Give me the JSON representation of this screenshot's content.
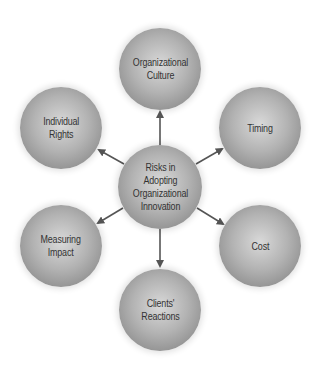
{
  "diagram": {
    "center": {
      "label": "Risks in\nAdopting\nOrganizational\nInnovation",
      "x": 160,
      "y": 187,
      "r": 42
    },
    "nodes": [
      {
        "id": "organizational-culture",
        "label": "Organizational\nCulture",
        "x": 160,
        "y": 69,
        "r": 41
      },
      {
        "id": "timing",
        "label": "Timing",
        "x": 260,
        "y": 128,
        "r": 41
      },
      {
        "id": "cost",
        "label": "Cost",
        "x": 260,
        "y": 246,
        "r": 41
      },
      {
        "id": "clients-reactions",
        "label": "Clients'\nReactions",
        "x": 160,
        "y": 310,
        "r": 41
      },
      {
        "id": "measuring-impact",
        "label": "Measuring\nImpact",
        "x": 61,
        "y": 246,
        "r": 41
      },
      {
        "id": "individual-rights",
        "label": "Individual\nRights",
        "x": 61,
        "y": 128,
        "r": 41
      }
    ],
    "arrow_color": "#555555"
  }
}
